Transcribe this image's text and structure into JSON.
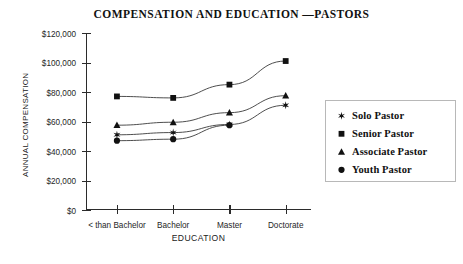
{
  "chart_data": {
    "type": "line",
    "title": "COMPENSATION AND EDUCATION —PASTORS",
    "xlabel": "EDUCATION",
    "ylabel": "ANNUAL COMPENSATION",
    "categories": [
      "< than Bachelor",
      "Bachelor",
      "Master",
      "Doctorate"
    ],
    "ylim": [
      0,
      120000
    ],
    "ytick_values": [
      0,
      20000,
      40000,
      60000,
      80000,
      100000,
      120000
    ],
    "ytick_labels": [
      "$0",
      "$20,000",
      "$40,000",
      "$60,000",
      "$80,000",
      "$100,000",
      "$120,000"
    ],
    "grid": false,
    "legend_position": "right",
    "series": [
      {
        "name": "Solo Pastor",
        "marker": "star",
        "values": [
          51000,
          52500,
          58000,
          71000
        ]
      },
      {
        "name": "Senior Pastor",
        "marker": "square",
        "values": [
          77000,
          76000,
          85000,
          101000
        ]
      },
      {
        "name": "Associate Pastor",
        "marker": "triangle",
        "values": [
          57500,
          59500,
          66000,
          77500
        ]
      },
      {
        "name": "Youth Pastor",
        "marker": "circle",
        "values": [
          47000,
          48000,
          57500,
          null
        ]
      }
    ]
  },
  "legend": {
    "items": [
      {
        "label": "Solo Pastor",
        "marker": "star"
      },
      {
        "label": "Senior Pastor",
        "marker": "square"
      },
      {
        "label": "Associate Pastor",
        "marker": "triangle"
      },
      {
        "label": "Youth Pastor",
        "marker": "circle"
      }
    ]
  },
  "colors": {
    "ink": "#1a1a1a",
    "axis": "#2b2b2b",
    "line": "#3a3a3a",
    "legend_border": "#b8b8b8",
    "background": "#ffffff"
  }
}
